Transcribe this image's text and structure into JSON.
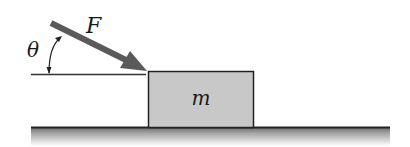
{
  "diagram": {
    "force_label": "F",
    "angle_label": "θ",
    "mass_label": "m",
    "colors": {
      "arrow": "#5a5a5a",
      "block_fill": "#c8c8c8",
      "block_stroke": "#222222",
      "ground_line": "#222222",
      "reference_line": "#333333"
    }
  }
}
